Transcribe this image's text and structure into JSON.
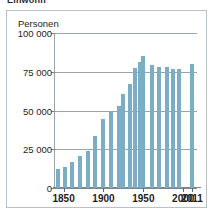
{
  "caption": {
    "text": "Einwohn"
  },
  "panel": {
    "unit_label": "Personen"
  },
  "colors": {
    "bar": "#79aec4",
    "grid": "#9aa3ab",
    "axis": "#7d868e",
    "frame": "#b9c0c6",
    "text": "#1d1d1d",
    "background": "#ffffff"
  },
  "chart_data": {
    "type": "bar",
    "title": "",
    "subtitle": "",
    "xlabel": "",
    "ylabel": "Personen",
    "ylim": [
      0,
      100000
    ],
    "yticks": [
      0,
      25000,
      50000,
      75000,
      100000
    ],
    "ytick_labels": [
      "0",
      "25 000",
      "50 000",
      "75 000",
      "100 000"
    ],
    "xticks": [
      1850,
      1900,
      1950,
      2000,
      2011
    ],
    "xtick_labels": [
      "1850",
      "1900",
      "1950",
      "2000",
      "2011"
    ],
    "grid": true,
    "legend": null,
    "categories": [
      "1843",
      "1852",
      "1861",
      "1871",
      "1880",
      "1890",
      "1900",
      "1910",
      "1919",
      "1925",
      "1933",
      "1939",
      "1946",
      "1950",
      "1961",
      "1970",
      "1980",
      "1987",
      "1995",
      "2011"
    ],
    "values": [
      12000,
      13800,
      17000,
      20800,
      23800,
      33600,
      44800,
      49300,
      52900,
      60500,
      66800,
      77500,
      81000,
      85000,
      79500,
      78300,
      78200,
      77100,
      77000,
      79800
    ],
    "annotations": []
  }
}
